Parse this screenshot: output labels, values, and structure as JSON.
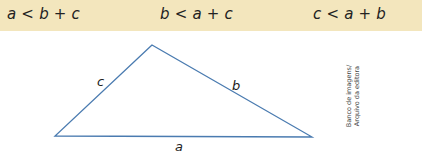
{
  "inequalities": [
    {
      "id": "a",
      "text": "a < b + c"
    },
    {
      "id": "b",
      "text": "b < a + c"
    },
    {
      "id": "c",
      "text": "c < a + b"
    }
  ],
  "triangle": {
    "vertices": {
      "top": [
        152,
        45
      ],
      "left": [
        55,
        136
      ],
      "right": [
        312,
        137
      ]
    },
    "stroke_color": "#4a7bb0",
    "labels": {
      "a": "a",
      "b": "b",
      "c": "c"
    }
  },
  "credit": {
    "line1": "Banco de imagens/",
    "line2": "Arquivo da editora"
  },
  "colors": {
    "banner": "#f3e6bd",
    "text": "#222222"
  }
}
